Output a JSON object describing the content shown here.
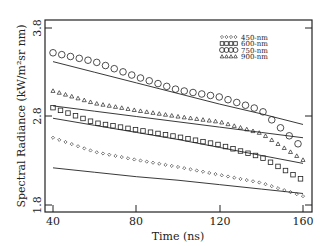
{
  "chart_data": {
    "type": "scatter",
    "title": "",
    "xlabel": "Time (ns)",
    "ylabel": "Spectral Radiance (kW/m²sr nm)",
    "xlim": [
      40,
      160
    ],
    "ylim": [
      1.8,
      3.8
    ],
    "xticks": [
      "40",
      "80",
      "120",
      "160"
    ],
    "yticks": [
      "1.8",
      "2.8",
      "3.8"
    ],
    "grid": false,
    "legend_position": "upper right",
    "x": [
      40,
      60,
      80,
      100,
      120,
      140,
      160
    ],
    "series": [
      {
        "name": "450-nm",
        "marker": "diamond",
        "values": [
          2.56,
          2.4,
          2.31,
          2.23,
          2.14,
          2.05,
          1.9
        ],
        "fit_line": [
          2.22,
          2.17,
          2.12,
          2.08,
          2.03,
          1.98,
          1.93
        ]
      },
      {
        "name": "600-nm",
        "marker": "square",
        "values": [
          2.9,
          2.73,
          2.65,
          2.57,
          2.48,
          2.34,
          2.08
        ],
        "fit_line": [
          2.78,
          2.7,
          2.62,
          2.54,
          2.45,
          2.36,
          2.27
        ]
      },
      {
        "name": "750-nm",
        "marker": "circle",
        "values": [
          3.52,
          3.42,
          3.25,
          3.1,
          3.02,
          2.87,
          2.44
        ],
        "fit_line": [
          3.42,
          3.3,
          3.18,
          3.06,
          2.94,
          2.83,
          2.71
        ]
      },
      {
        "name": "900-nm",
        "marker": "triangle",
        "values": [
          3.09,
          2.95,
          2.87,
          2.8,
          2.74,
          2.61,
          2.31
        ],
        "fit_line": [
          2.92,
          2.86,
          2.8,
          2.74,
          2.68,
          2.62,
          2.56
        ]
      }
    ]
  },
  "labels": {
    "xlabel": "Time (ns)",
    "ylabel": "Spectral Radiance (kW/m²sr nm)",
    "xticks": [
      "40",
      "80",
      "120",
      "160"
    ],
    "yticks": [
      "1.8",
      "2.8",
      "3.8"
    ],
    "legend": [
      "450-nm",
      "600-nm",
      "750-nm",
      "900-nm"
    ]
  }
}
